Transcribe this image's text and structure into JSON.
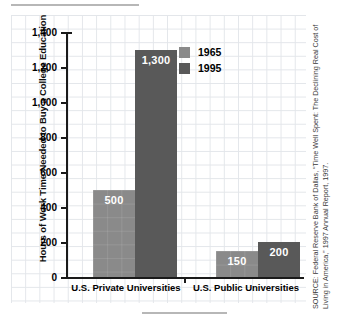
{
  "chart_data": {
    "type": "bar",
    "title": "",
    "xlabel": "",
    "ylabel": "Hours of Work Time Needed to Buy a College Education",
    "categories": [
      "U.S. Private Universities",
      "U.S. Public Universities"
    ],
    "series": [
      {
        "name": "1965",
        "color": "#8a8a8a",
        "values": [
          500,
          150
        ],
        "labels": [
          "500",
          "150"
        ]
      },
      {
        "name": "1995",
        "color": "#595959",
        "values": [
          1300,
          200
        ],
        "labels": [
          "1,300",
          "200"
        ]
      }
    ],
    "ylim": [
      0,
      1400
    ],
    "yticks": [
      0,
      200,
      400,
      600,
      800,
      1000,
      1200,
      1400
    ],
    "ytick_labels": [
      "0",
      "200",
      "400",
      "600",
      "800",
      "1,000",
      "1,200",
      "1,400"
    ],
    "grid": true,
    "legend_position": "upper right"
  },
  "legend": {
    "entries": [
      {
        "label": "1965",
        "color": "#8a8a8a"
      },
      {
        "label": "1995",
        "color": "#595959"
      }
    ]
  },
  "source": {
    "text": "SOURCE: Federal Reserve Bank of Dallas, “Time Well Spent: The Declining Real Cost of Living in America,” 1997 Annual Report, 1997."
  }
}
